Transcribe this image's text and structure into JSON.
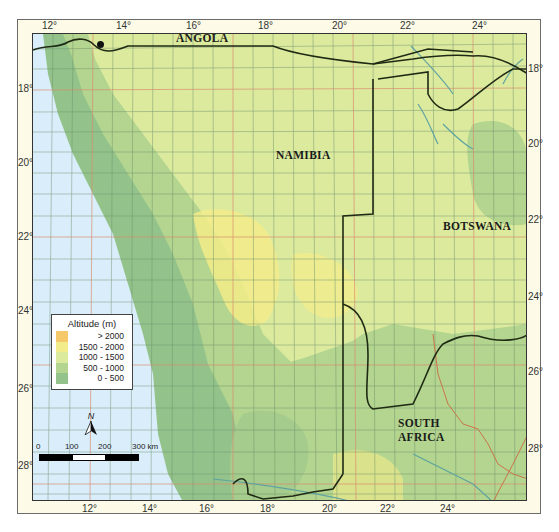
{
  "map": {
    "countries": [
      {
        "name": "ANGOLA",
        "x": 178,
        "y": 33
      },
      {
        "name": "NAMIBIA",
        "x": 276,
        "y": 150
      },
      {
        "name": "BOTSWANA",
        "x": 443,
        "y": 221
      },
      {
        "name": "SOUTH",
        "x": 398,
        "y": 418
      },
      {
        "name": "AFRICA",
        "x": 398,
        "y": 432
      }
    ],
    "longitude_ticks_top": [
      "12°",
      "14°",
      "16°",
      "18°",
      "20°",
      "22°",
      "24°"
    ],
    "longitude_ticks_bottom": [
      "12°",
      "14°",
      "16°",
      "18°",
      "20°",
      "22°",
      "24°"
    ],
    "latitude_ticks_left": [
      "18°",
      "20°",
      "22°",
      "24°",
      "26°",
      "28°"
    ],
    "latitude_ticks_right": [
      "18°",
      "20°",
      "22°",
      "24°",
      "26°",
      "28°"
    ]
  },
  "legend": {
    "title": "Altitude (m)",
    "items": [
      {
        "label": "> 2000",
        "color": "#f5c96a"
      },
      {
        "label": "1500 - 2000",
        "color": "#f3ec8a"
      },
      {
        "label": "1000 - 1500",
        "color": "#dcea9e"
      },
      {
        "label": "500 - 1000",
        "color": "#b3d58f"
      },
      {
        "label": "0 - 500",
        "color": "#93c38a"
      }
    ]
  },
  "compass": {
    "label": "N"
  },
  "scale": {
    "labels": [
      "0",
      "100",
      "200",
      "300 km"
    ]
  },
  "colors": {
    "sea": "#d9eefa",
    "lowland": "#93c38a",
    "midland": "#b3d58f",
    "plateau": "#dcea9e",
    "highland": "#f3ec8a",
    "border": "#1f2a14",
    "river": "#5fa3a0",
    "province": "#c9744a",
    "grid_major": "#d98b70",
    "grid_minor": "#6b8e6b"
  }
}
